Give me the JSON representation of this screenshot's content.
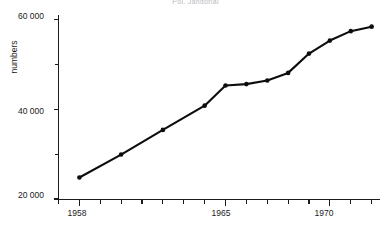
{
  "chart_data": {
    "type": "line",
    "title": "Pol. Janitorial",
    "xlabel": "",
    "ylabel": "numbers",
    "x": [
      1958,
      1960,
      1962,
      1964,
      1965,
      1966,
      1967,
      1968,
      1969,
      1970,
      1971,
      1972
    ],
    "values": [
      24800,
      29900,
      35400,
      40800,
      45300,
      45600,
      46400,
      48100,
      52400,
      55300,
      57400,
      58400
    ],
    "series": [
      {
        "name": "numbers",
        "values": [
          24800,
          29900,
          35400,
          40800,
          45300,
          45600,
          46400,
          48100,
          52400,
          55300,
          57400,
          58400
        ]
      }
    ],
    "xlim": [
      1957,
      1972.4
    ],
    "ylim": [
      20000,
      61000
    ],
    "yticks": [
      20000,
      40000,
      60000
    ],
    "ytick_labels": [
      "20 000",
      "40 000",
      "60 000"
    ],
    "yminor_ticks": [
      30000,
      50000
    ],
    "xticks": [
      1957,
      1958,
      1959,
      1960,
      1961,
      1962,
      1963,
      1964,
      1965,
      1966,
      1967,
      1968,
      1969,
      1970,
      1971,
      1972
    ],
    "xtick_labels": [
      {
        "value": 1958,
        "label": "1958"
      },
      {
        "value": 1965,
        "label": "1965"
      },
      {
        "value": 1970,
        "label": "1970"
      }
    ],
    "grid": false,
    "legend": null,
    "marker": "circle",
    "line_color": "#0d0d0d"
  }
}
